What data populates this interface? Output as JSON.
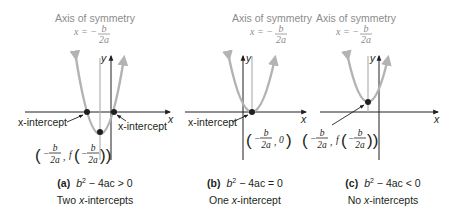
{
  "colors": {
    "ink": "#231f20",
    "parabola": "#b3b3b3",
    "axis_of_symmetry_text": "#8c8c8c"
  },
  "axis_of_symmetry": {
    "title": "Axis of symmetry",
    "eq_lhs": "x = −",
    "eq_num": "b",
    "eq_den": "2a"
  },
  "axes": {
    "x_label": "x",
    "y_label": "y"
  },
  "vertex_label": {
    "open": "(",
    "minus": "−",
    "num": "b",
    "den": "2a",
    "comma": ",",
    "f": "f",
    "close": "))",
    "zero": "0",
    "close_single": ")"
  },
  "panels": [
    {
      "id": "a",
      "tag": "(a)",
      "condition_pre": "b",
      "condition_exp": "2",
      "condition_post": " − 4ac > 0",
      "description_pre": "Two ",
      "description_it": "x",
      "description_post": "-intercepts",
      "intercept_label_left": "x-intercept",
      "intercept_label_right": "x-intercept"
    },
    {
      "id": "b",
      "tag": "(b)",
      "condition_pre": "b",
      "condition_exp": "2",
      "condition_post": " − 4ac = 0",
      "description_pre": "One ",
      "description_it": "x",
      "description_post": "-intercept",
      "intercept_label_left": "x-intercept"
    },
    {
      "id": "c",
      "tag": "(c)",
      "condition_pre": "b",
      "condition_exp": "2",
      "condition_post": " − 4ac < 0",
      "description_pre": "No ",
      "description_it": "x",
      "description_post": "-intercepts"
    }
  ]
}
